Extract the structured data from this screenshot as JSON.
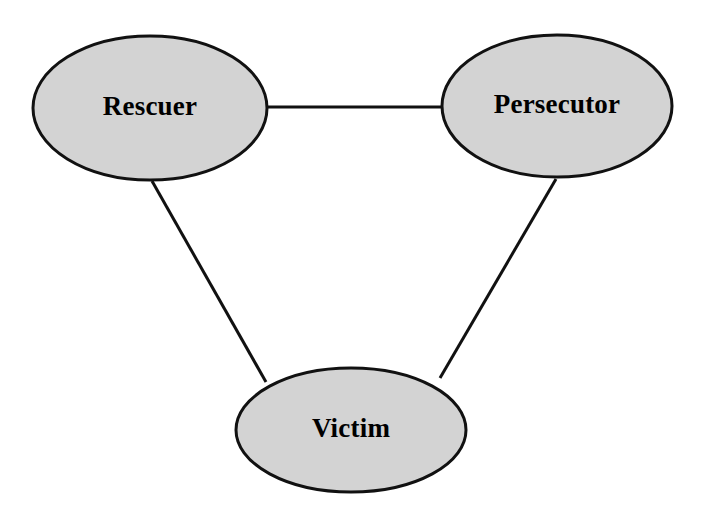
{
  "diagram": {
    "type": "node-link-diagram",
    "background_color": "#ffffff",
    "node_fill_color": "#d3d3d3",
    "node_stroke_color": "#111111",
    "label_color": "#000000",
    "nodes": [
      {
        "id": "rescuer",
        "label": "Rescuer",
        "cx": 150,
        "cy": 108,
        "rx": 117,
        "ry": 72
      },
      {
        "id": "persecutor",
        "label": "Persecutor",
        "cx": 557,
        "cy": 106,
        "rx": 115,
        "ry": 71
      },
      {
        "id": "victim",
        "label": "Victim",
        "cx": 351,
        "cy": 430,
        "rx": 115,
        "ry": 62
      }
    ],
    "edges": [
      {
        "id": "rescuer-persecutor",
        "from": "rescuer",
        "to": "persecutor",
        "x1": 267,
        "y1": 107,
        "x2": 443,
        "y2": 107
      },
      {
        "id": "rescuer-victim",
        "from": "rescuer",
        "to": "victim",
        "x1": 152,
        "y1": 181,
        "x2": 266,
        "y2": 382
      },
      {
        "id": "persecutor-victim",
        "from": "persecutor",
        "to": "victim",
        "x1": 556,
        "y1": 179,
        "x2": 440,
        "y2": 378
      }
    ]
  }
}
